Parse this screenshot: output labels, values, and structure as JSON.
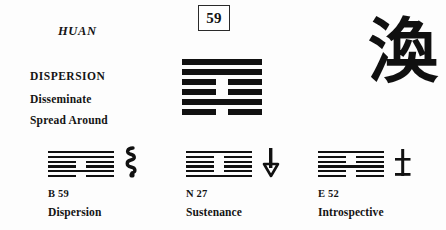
{
  "card": {
    "romanization": "HUAN",
    "number": "59",
    "keyword_main": "DISPERSION",
    "keyword_sub_1": "Disseminate",
    "keyword_sub_2": "Spread Around",
    "calligraphy_character": "渙",
    "ink_color": "#111111",
    "background_color": "#fdfdfd"
  },
  "main_hexagram": {
    "name": "hexagram-59-huan",
    "lines_top_to_bottom": [
      "yang",
      "yang",
      "yin",
      "yin",
      "yang",
      "yin"
    ]
  },
  "bottom_panels": [
    {
      "code": "B 59",
      "name": "Dispersion",
      "glyph": "coiled-serpent-icon",
      "lines_top_to_bottom": [
        "yang",
        "yang",
        "yin",
        "yin",
        "yang",
        "yin"
      ]
    },
    {
      "code": "N 27",
      "name": "Sustenance",
      "glyph": "down-arrow-icon",
      "lines_top_to_bottom": [
        "yang",
        "yin",
        "yin",
        "yin",
        "yin",
        "yang"
      ]
    },
    {
      "code": "E 52",
      "name": "Introspective",
      "glyph": "vertical-bar-cross-icon",
      "lines_top_to_bottom": [
        "yang",
        "yin",
        "yin",
        "yang",
        "yin",
        "yin"
      ]
    }
  ]
}
